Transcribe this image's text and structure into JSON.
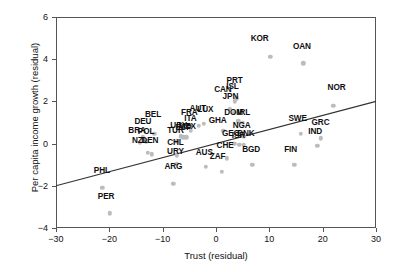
{
  "chart_data": {
    "type": "scatter",
    "title": "",
    "xlabel": "Trust (residual)",
    "ylabel": "Per capita income growth (residual)",
    "xlim": [
      -30,
      30
    ],
    "ylim": [
      -4,
      6
    ],
    "xticks": [
      -30,
      -20,
      -10,
      0,
      10,
      20,
      30
    ],
    "yticks": [
      -4,
      -2,
      0,
      2,
      4,
      6
    ],
    "grid": false,
    "legend": null,
    "point_color": "#bcbcbc",
    "line_color": "#333333",
    "fit_line": {
      "x": [
        -30,
        30
      ],
      "y": [
        -2.0,
        2.0
      ]
    },
    "points": [
      {
        "label": "KOR",
        "x": 10.2,
        "y": 4.1,
        "lx": 8.2,
        "ly": 4.7
      },
      {
        "label": "OAN",
        "x": 16.4,
        "y": 3.8,
        "lx": 16.1,
        "ly": 4.35
      },
      {
        "label": "NOR",
        "x": 22.0,
        "y": 1.8,
        "lx": 22.6,
        "ly": 2.4
      },
      {
        "label": "PRT",
        "x": 3.8,
        "y": 2.15,
        "lx": 3.5,
        "ly": 2.75
      },
      {
        "label": "ISL",
        "x": 3.5,
        "y": 2.0,
        "lx": 3.1,
        "ly": 2.45
      },
      {
        "label": "CAN",
        "x": 2.6,
        "y": 1.65,
        "lx": 1.3,
        "ly": 2.3
      },
      {
        "label": "JPN",
        "x": 3.4,
        "y": 1.45,
        "lx": 2.7,
        "ly": 1.95
      },
      {
        "label": "AUT",
        "x": -3.2,
        "y": 0.85,
        "lx": -3.4,
        "ly": 1.4
      },
      {
        "label": "LUX",
        "x": -2.3,
        "y": 0.95,
        "lx": -2.0,
        "ly": 1.35
      },
      {
        "label": "DOM",
        "x": 4.2,
        "y": 1.05,
        "lx": 3.3,
        "ly": 1.2
      },
      {
        "label": "IRL",
        "x": 5.0,
        "y": 1.0,
        "lx": 5.2,
        "ly": 1.2
      },
      {
        "label": "FRA",
        "x": -5.0,
        "y": 0.85,
        "lx": -5.0,
        "ly": 1.2
      },
      {
        "label": "BEL",
        "x": -11.6,
        "y": 0.45,
        "lx": -11.8,
        "ly": 1.1
      },
      {
        "label": "ITA",
        "x": -4.7,
        "y": 0.6,
        "lx": -4.8,
        "ly": 0.95
      },
      {
        "label": "GHA",
        "x": 1.4,
        "y": 0.6,
        "lx": 0.3,
        "ly": 0.85
      },
      {
        "label": "SWE",
        "x": 15.9,
        "y": 0.45,
        "lx": 15.3,
        "ly": 0.95
      },
      {
        "label": "GRC",
        "x": 19.7,
        "y": 0.25,
        "lx": 19.6,
        "ly": 0.75
      },
      {
        "label": "DEU",
        "x": -13.7,
        "y": 0.3,
        "lx": -13.7,
        "ly": 0.8
      },
      {
        "label": "NGA",
        "x": 5.2,
        "y": 0.35,
        "lx": 4.8,
        "ly": 0.6
      },
      {
        "label": "URY",
        "x": -6.6,
        "y": 0.35,
        "lx": -7.0,
        "ly": 0.6
      },
      {
        "label": "MEX",
        "x": -5.6,
        "y": 0.3,
        "lx": -5.4,
        "ly": 0.55
      },
      {
        "label": "ESP",
        "x": -6.1,
        "y": 0.3,
        "lx": -6.1,
        "ly": 0.5
      },
      {
        "label": "BRA",
        "x": -14.3,
        "y": 0.05,
        "lx": -14.8,
        "ly": 0.35
      },
      {
        "label": "POL",
        "x": -13.1,
        "y": 0.1,
        "lx": -13.1,
        "ly": 0.3
      },
      {
        "label": "TUR",
        "x": -7.4,
        "y": 0.1,
        "lx": -7.6,
        "ly": 0.35
      },
      {
        "label": "IND",
        "x": 19.0,
        "y": -0.1,
        "lx": 18.6,
        "ly": 0.3
      },
      {
        "label": "GEO",
        "x": 3.4,
        "y": 0.0,
        "lx": 2.8,
        "ly": 0.2
      },
      {
        "label": "DNK",
        "x": 5.2,
        "y": -0.05,
        "lx": 5.6,
        "ly": 0.2
      },
      {
        "label": "ISR",
        "x": 4.4,
        "y": -0.05,
        "lx": 4.2,
        "ly": 0.1
      },
      {
        "label": "NZL",
        "x": -12.8,
        "y": -0.45,
        "lx": -14.3,
        "ly": -0.1
      },
      {
        "label": "DEN",
        "x": -12.0,
        "y": -0.5,
        "lx": -12.4,
        "ly": -0.12
      },
      {
        "label": "CHL",
        "x": -7.4,
        "y": -0.55,
        "lx": -7.6,
        "ly": -0.2
      },
      {
        "label": "CHE",
        "x": 2.0,
        "y": -0.7,
        "lx": 1.7,
        "ly": -0.35
      },
      {
        "label": "FIN",
        "x": 14.7,
        "y": -1.0,
        "lx": 14.0,
        "ly": -0.55
      },
      {
        "label": "BGD",
        "x": 6.8,
        "y": -1.0,
        "lx": 6.6,
        "ly": -0.55
      },
      {
        "label": "URY2",
        "x": -7.4,
        "y": -0.95,
        "lx": -7.6,
        "ly": -0.62
      },
      {
        "label": "AUS",
        "x": -1.9,
        "y": -1.1,
        "lx": -2.2,
        "ly": -0.68
      },
      {
        "label": "ZAF",
        "x": 1.1,
        "y": -1.35,
        "lx": 0.3,
        "ly": -0.85
      },
      {
        "label": "ARG",
        "x": -8.0,
        "y": -1.9,
        "lx": -8.0,
        "ly": -1.35
      },
      {
        "label": "PHL",
        "x": -21.3,
        "y": -2.1,
        "lx": -21.4,
        "ly": -1.55
      },
      {
        "label": "PER",
        "x": -19.9,
        "y": -3.3,
        "lx": -20.6,
        "ly": -2.75
      }
    ]
  }
}
